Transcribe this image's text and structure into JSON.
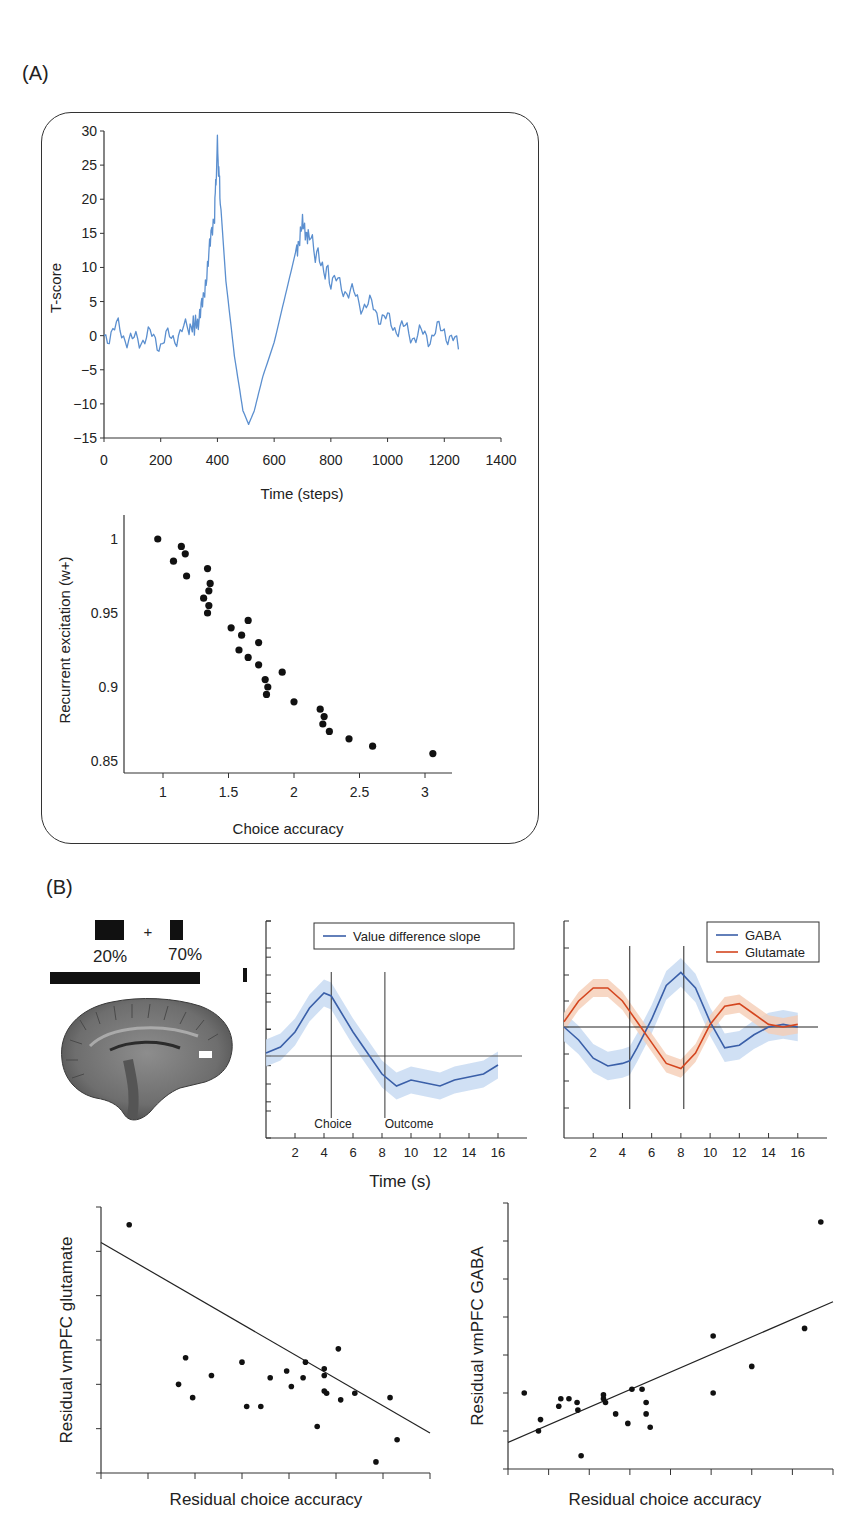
{
  "panels": {
    "a_label": "(A)",
    "b_label": "(B)"
  },
  "stimulus": {
    "left_pct": "20%",
    "plus": "+",
    "right_pct": "70%"
  },
  "colors": {
    "blue_line": "#5b8fcf",
    "gaba": "#3a5fa8",
    "glutamate": "#d4461f",
    "blue_band": "#c8daf2",
    "orange_band": "#f5cdb5",
    "ink": "#222222"
  },
  "chart_data": [
    {
      "id": "A-timeseries",
      "type": "line",
      "title": "",
      "xlabel": "Time (steps)",
      "ylabel": "T-score",
      "xlim": [
        0,
        1400
      ],
      "ylim": [
        -15,
        30
      ],
      "xticks": [
        0,
        200,
        400,
        600,
        800,
        1000,
        1200,
        1400
      ],
      "yticks": [
        30,
        25,
        20,
        15,
        10,
        5,
        0,
        -5,
        -10,
        -15
      ],
      "series": [
        {
          "name": "T-score",
          "color": "#5b8fcf",
          "x": [
            0,
            50,
            100,
            150,
            200,
            250,
            300,
            330,
            350,
            370,
            390,
            400,
            410,
            430,
            460,
            490,
            510,
            530,
            560,
            600,
            640,
            680,
            700,
            720,
            760,
            800,
            850,
            900,
            950,
            1000,
            1050,
            1100,
            1150,
            1200,
            1250
          ],
          "y": [
            0,
            1,
            -1,
            0,
            -1,
            0,
            1,
            2,
            5,
            12,
            18,
            28,
            20,
            8,
            -3,
            -11,
            -13,
            -11,
            -6,
            -1,
            6,
            13,
            16,
            15,
            11,
            8,
            7,
            5,
            4,
            2,
            1,
            0,
            0,
            1,
            -2
          ]
        }
      ]
    },
    {
      "id": "A-scatter",
      "type": "scatter",
      "title": "",
      "xlabel": "Choice accuracy",
      "ylabel": "Recurrent excitation (w+)",
      "xlim": [
        0.75,
        3.2
      ],
      "ylim": [
        0.84,
        1.02
      ],
      "xticks": [
        1,
        1.5,
        2,
        2.5,
        3
      ],
      "yticks": [
        0.85,
        0.9,
        0.95,
        1
      ],
      "points": [
        [
          0.96,
          1.0
        ],
        [
          1.08,
          0.985
        ],
        [
          1.14,
          0.995
        ],
        [
          1.17,
          0.99
        ],
        [
          1.18,
          0.975
        ],
        [
          1.34,
          0.98
        ],
        [
          1.36,
          0.97
        ],
        [
          1.35,
          0.965
        ],
        [
          1.31,
          0.96
        ],
        [
          1.35,
          0.955
        ],
        [
          1.34,
          0.95
        ],
        [
          1.52,
          0.94
        ],
        [
          1.65,
          0.945
        ],
        [
          1.6,
          0.935
        ],
        [
          1.73,
          0.93
        ],
        [
          1.58,
          0.925
        ],
        [
          1.65,
          0.92
        ],
        [
          1.73,
          0.915
        ],
        [
          1.91,
          0.91
        ],
        [
          1.78,
          0.905
        ],
        [
          1.8,
          0.9
        ],
        [
          1.79,
          0.895
        ],
        [
          2.0,
          0.89
        ],
        [
          2.2,
          0.885
        ],
        [
          2.23,
          0.88
        ],
        [
          2.22,
          0.875
        ],
        [
          2.27,
          0.87
        ],
        [
          2.42,
          0.865
        ],
        [
          2.6,
          0.86
        ],
        [
          3.06,
          0.855
        ]
      ]
    },
    {
      "id": "B-value-difference",
      "type": "line",
      "xlabel": "Time (s)",
      "ylabel": "",
      "xlim": [
        0,
        18
      ],
      "xticks": [
        2,
        4,
        6,
        8,
        10,
        12,
        14,
        16
      ],
      "legend": [
        "Value difference slope"
      ],
      "annotations": [
        "Choice",
        "Outcome"
      ],
      "event_lines_x": [
        4.5,
        8.2
      ],
      "series": [
        {
          "name": "Value difference slope",
          "color": "#3a5fa8",
          "x": [
            0,
            1,
            2,
            3,
            4,
            4.5,
            5,
            6,
            7,
            8,
            9,
            10,
            11,
            12,
            13,
            14,
            15,
            16
          ],
          "y": [
            0.1,
            0.3,
            0.8,
            1.6,
            2.1,
            2.0,
            1.6,
            0.8,
            0.1,
            -0.6,
            -1.0,
            -0.8,
            -0.9,
            -1.0,
            -0.8,
            -0.7,
            -0.6,
            -0.3
          ]
        }
      ]
    },
    {
      "id": "B-gaba-glutamate",
      "type": "line",
      "xlabel": "Time (s)",
      "xlim": [
        0,
        18
      ],
      "xticks": [
        2,
        4,
        6,
        8,
        10,
        12,
        14,
        16
      ],
      "legend": [
        "GABA",
        "Glutamate"
      ],
      "event_lines_x": [
        4.5,
        8.2
      ],
      "series": [
        {
          "name": "GABA",
          "color": "#3a5fa8",
          "x": [
            0,
            1,
            2,
            3,
            4,
            4.5,
            5,
            6,
            7,
            8,
            9,
            10,
            11,
            12,
            13,
            14,
            15,
            16
          ],
          "y": [
            0,
            -0.5,
            -1.2,
            -1.5,
            -1.4,
            -1.3,
            -0.8,
            0.3,
            1.6,
            2.1,
            1.5,
            0.2,
            -0.8,
            -0.7,
            -0.3,
            0,
            0.1,
            0
          ]
        },
        {
          "name": "Glutamate",
          "color": "#d4461f",
          "x": [
            0,
            1,
            2,
            3,
            4,
            4.5,
            5,
            6,
            7,
            8,
            9,
            10,
            11,
            12,
            13,
            14,
            15,
            16
          ],
          "y": [
            0.2,
            1.0,
            1.5,
            1.5,
            1.0,
            0.6,
            0.2,
            -0.6,
            -1.4,
            -1.6,
            -1.0,
            0.1,
            0.8,
            0.9,
            0.5,
            0.1,
            0,
            0.1
          ]
        }
      ]
    },
    {
      "id": "B-scatter-glutamate",
      "type": "scatter",
      "xlabel": "Residual choice accuracy",
      "ylabel": "Residual vmPFC glutamate",
      "fit_line": {
        "x": [
          0,
          7
        ],
        "y": [
          5.2,
          0.9
        ]
      },
      "xlim": [
        0,
        7
      ],
      "ylim": [
        0,
        6
      ],
      "points": [
        [
          0.6,
          5.6
        ],
        [
          1.65,
          2.0
        ],
        [
          1.8,
          2.6
        ],
        [
          1.95,
          1.7
        ],
        [
          2.35,
          2.2
        ],
        [
          3.0,
          2.5
        ],
        [
          3.1,
          1.5
        ],
        [
          3.4,
          1.5
        ],
        [
          3.6,
          2.15
        ],
        [
          3.95,
          2.3
        ],
        [
          4.05,
          1.95
        ],
        [
          4.3,
          2.15
        ],
        [
          4.35,
          2.5
        ],
        [
          4.6,
          1.05
        ],
        [
          4.75,
          2.2
        ],
        [
          4.75,
          2.35
        ],
        [
          4.75,
          1.85
        ],
        [
          4.8,
          1.8
        ],
        [
          5.05,
          2.8
        ],
        [
          5.1,
          1.65
        ],
        [
          5.4,
          1.8
        ],
        [
          5.85,
          0.25
        ],
        [
          6.15,
          1.7
        ],
        [
          6.3,
          0.75
        ]
      ]
    },
    {
      "id": "B-scatter-gaba",
      "type": "scatter",
      "xlabel": "Residual choice accuracy",
      "ylabel": "Residual vmPFC GABA",
      "fit_line": {
        "x": [
          0,
          8
        ],
        "y": [
          0.7,
          4.4
        ]
      },
      "xlim": [
        0,
        8
      ],
      "ylim": [
        0,
        7
      ],
      "points": [
        [
          0.4,
          2.0
        ],
        [
          0.75,
          1.0
        ],
        [
          0.8,
          1.3
        ],
        [
          1.25,
          1.65
        ],
        [
          1.3,
          1.85
        ],
        [
          1.5,
          1.85
        ],
        [
          1.7,
          1.75
        ],
        [
          1.72,
          1.55
        ],
        [
          1.8,
          0.35
        ],
        [
          2.35,
          1.95
        ],
        [
          2.35,
          1.85
        ],
        [
          2.4,
          1.75
        ],
        [
          2.65,
          1.45
        ],
        [
          2.95,
          1.2
        ],
        [
          3.05,
          2.1
        ],
        [
          3.3,
          2.1
        ],
        [
          3.4,
          1.45
        ],
        [
          3.4,
          1.75
        ],
        [
          3.5,
          1.1
        ],
        [
          5.05,
          2.0
        ],
        [
          5.05,
          3.5
        ],
        [
          6.0,
          2.7
        ],
        [
          7.3,
          3.7
        ],
        [
          7.7,
          6.5
        ]
      ]
    }
  ],
  "labels": {
    "a_line_ylabel": "T-score",
    "a_line_xlabel": "Time (steps)",
    "a_scatter_ylabel": "Recurrent excitation (w+)",
    "a_scatter_xlabel": "Choice accuracy",
    "b_time_xlabel": "Time (s)",
    "b_legend_vds": "Value difference slope",
    "b_legend_gaba": "GABA",
    "b_legend_glu": "Glutamate",
    "b_choice": "Choice",
    "b_outcome": "Outcome",
    "b_glu_ylabel": "Residual vmPFC glutamate",
    "b_gaba_ylabel": "Residual vmPFC GABA",
    "b_glu_xlabel": "Residual choice accuracy",
    "b_gaba_xlabel": "Residual choice accuracy"
  }
}
